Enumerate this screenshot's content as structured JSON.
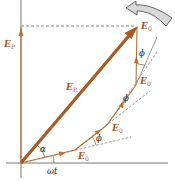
{
  "diagram": {
    "type": "phasor-diagram",
    "colors": {
      "phasor": "#b8702f",
      "resultant": "#a85a22",
      "axis": "#555555",
      "dashed": "#666666",
      "rotation_arrow_fill": "#d8d8d8",
      "rotation_arrow_stroke": "#444444",
      "label": "#a5582a",
      "angle_label": "#222222"
    },
    "labels": {
      "vertical_component": {
        "main": "E",
        "sub": "P"
      },
      "resultant": {
        "main": "E",
        "sub": "R"
      },
      "phasor_1": {
        "main": "E",
        "sub": "0"
      },
      "phasor_2": {
        "main": "E",
        "sub": "0"
      },
      "phasor_3": {
        "main": "E",
        "sub": "0"
      },
      "phasor_4": {
        "main": "E",
        "sub": "0"
      },
      "angle_alpha": "α",
      "angle_omega_t": "ωt",
      "angle_phi_1": "ϕ",
      "angle_phi_2": "ϕ",
      "angle_phi_3": "ϕ"
    },
    "rotation_indicator": "counterclockwise-rotation-arrow"
  }
}
